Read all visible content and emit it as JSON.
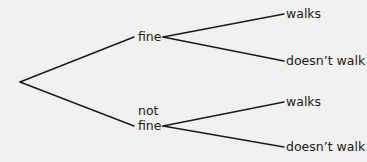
{
  "tree": {
    "root": {
      "x": 20,
      "y": 82
    },
    "level1": [
      {
        "id": "fine",
        "label_lines": [
          "fine"
        ],
        "label": "fine",
        "edge_end": {
          "x": 134,
          "y": 37
        },
        "split": {
          "x": 163,
          "y": 37
        },
        "children": [
          {
            "id": "fine-walks",
            "label": "walks",
            "edge_end": {
              "x": 284,
              "y": 14
            }
          },
          {
            "id": "fine-doesnt-walk",
            "label": "doesn’t walk",
            "edge_end": {
              "x": 284,
              "y": 61
            }
          }
        ]
      },
      {
        "id": "not-fine",
        "label_lines": [
          "not",
          "fine"
        ],
        "label_line1": "not",
        "label_line2": "fine",
        "edge_end": {
          "x": 134,
          "y": 126
        },
        "split": {
          "x": 163,
          "y": 126
        },
        "children": [
          {
            "id": "notfine-walks",
            "label": "walks",
            "edge_end": {
              "x": 284,
              "y": 102
            }
          },
          {
            "id": "notfine-doesnt-walk",
            "label": "doesn’t walk",
            "edge_end": {
              "x": 284,
              "y": 147
            }
          }
        ]
      }
    ]
  },
  "colors": {
    "background": "#f1f1ef",
    "line": "#1a1a1a",
    "text": "#1a1a1a"
  }
}
